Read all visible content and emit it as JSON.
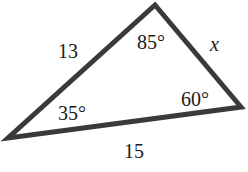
{
  "diagram": {
    "type": "triangle",
    "stroke_color": "#3a3a3a",
    "vertices": {
      "top": [
        155,
        5
      ],
      "right": [
        241,
        107
      ],
      "bottom_left": [
        8,
        138
      ]
    },
    "sides": {
      "left": "13",
      "right": "x",
      "bottom": "15"
    },
    "angles": {
      "top": "85°",
      "bottom_left": "35°",
      "right": "60°"
    }
  }
}
